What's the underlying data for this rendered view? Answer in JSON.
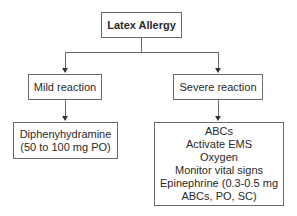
{
  "diagram": {
    "type": "flowchart",
    "root": {
      "label": "Latex Allergy"
    },
    "branches": [
      {
        "label": "Mild reaction",
        "treatment": {
          "lines": [
            "Diphenyhydramine",
            "(50 to 100 mg PO)"
          ]
        }
      },
      {
        "label": "Severe reaction",
        "treatment": {
          "lines": [
            "ABCs",
            "Activate EMS",
            "Oxygen",
            "Monitor vital signs",
            "Epinephrine (0.3-0.5 mg",
            "ABCs, PO, SC)"
          ]
        }
      }
    ],
    "colors": {
      "border": "#6a6a6a",
      "arrow": "#333333",
      "text": "#2a2a2a",
      "background": "#ffffff"
    }
  }
}
